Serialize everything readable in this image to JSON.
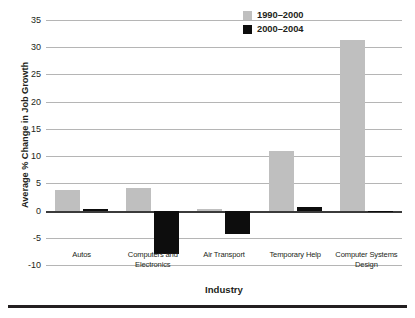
{
  "chart_data": {
    "type": "bar",
    "title": "",
    "subtitle": "",
    "xlabel": "Industry",
    "ylabel": "Average % Change in Job Growth",
    "categories": [
      "Autos",
      "Computers and Electronics",
      "Air Transport",
      "Temporary Help",
      "Computer Systems Design"
    ],
    "category_lines": [
      [
        "Autos"
      ],
      [
        "Computers and",
        "Electronics"
      ],
      [
        "Air Transport"
      ],
      [
        "Temporary Help"
      ],
      [
        "Computer Systems",
        "Design"
      ]
    ],
    "series": [
      {
        "name": "1990–2000",
        "color": "#bfbfbf",
        "values": [
          3.8,
          4.1,
          0.3,
          11.0,
          31.3
        ]
      },
      {
        "name": "2000–2004",
        "color": "#0d0d0d",
        "values": [
          0.3,
          -8.0,
          -4.3,
          0.7,
          -0.3
        ]
      }
    ],
    "ylim": [
      -10,
      35
    ],
    "ytick_values": [
      35,
      30,
      25,
      20,
      15,
      10,
      5,
      0,
      -5,
      -10
    ],
    "ytick_labels": [
      "35",
      "30",
      "25",
      "20",
      "15",
      "10",
      "5",
      "0",
      "-5",
      "-10"
    ],
    "grid": true,
    "grid_axis": "y",
    "legend_position": "top-right",
    "legend": [
      "1990–2000",
      "2000–2004"
    ]
  },
  "colors": {
    "series_1990_2000": "#bfbfbf",
    "series_2000_2004": "#0d0d0d",
    "gridline": "#b5b5b5",
    "zero_line": "#3b3b3b",
    "text": "#231f20",
    "background": "#ffffff",
    "bottom_rule": "#231f20"
  }
}
